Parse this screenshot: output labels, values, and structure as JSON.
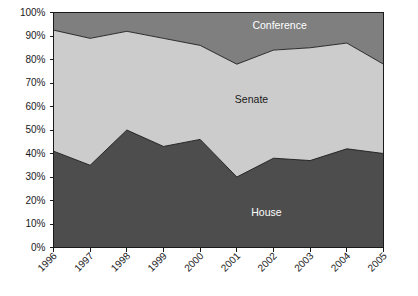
{
  "chart_data": {
    "type": "area",
    "title": "",
    "subtitle": "",
    "xlabel": "",
    "ylabel": "",
    "stacked": true,
    "percent": true,
    "grid": false,
    "legend_position": "inline-labels",
    "ylim": [
      0,
      100
    ],
    "ytick_labels": [
      "100%",
      "90%",
      "80%",
      "70%",
      "60%",
      "50%",
      "40%",
      "30%",
      "20%",
      "10%",
      "0%"
    ],
    "ytick_values": [
      100,
      90,
      80,
      70,
      60,
      50,
      40,
      30,
      20,
      10,
      0
    ],
    "categories": [
      "1996",
      "1997",
      "1998",
      "1999",
      "2000",
      "2001",
      "2002",
      "2003",
      "2004",
      "2005"
    ],
    "series": [
      {
        "name": "House",
        "color": "#4d4d4d",
        "values": [
          41,
          35,
          50,
          43,
          46,
          30,
          38,
          37,
          42,
          40
        ]
      },
      {
        "name": "Senate",
        "color": "#cccccc",
        "values": [
          51.5,
          54,
          42,
          46,
          40,
          48,
          46,
          48,
          45,
          38
        ]
      },
      {
        "name": "Conference",
        "color": "#7f7f7f",
        "values": [
          7.5,
          11,
          8,
          11,
          14,
          22,
          16,
          15,
          13,
          22
        ]
      }
    ],
    "cumulative_upper": {
      "house_top": [
        41,
        35,
        50,
        43,
        46,
        30,
        38,
        37,
        42,
        40
      ],
      "senate_top": [
        92.5,
        89,
        92,
        89,
        86,
        78,
        84,
        85,
        87,
        78
      ]
    },
    "annotations": [
      {
        "text": "Conference",
        "x_frac": 0.685,
        "y_value": 94.5
      },
      {
        "text": "Senate",
        "x_frac": 0.6,
        "y_value": 63
      },
      {
        "text": "House",
        "x_frac": 0.645,
        "y_value": 15
      }
    ]
  },
  "colors": {
    "house": "#4d4d4d",
    "senate": "#cccccc",
    "conference": "#7f7f7f",
    "axis": "#1a1a1a",
    "background": "#ffffff"
  }
}
